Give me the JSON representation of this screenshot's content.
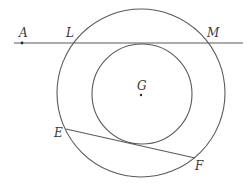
{
  "diagram": {
    "type": "geometry",
    "colors": {
      "stroke": "#5a5a5a",
      "label": "#3a3a3a",
      "background": "#ffffff"
    },
    "center": {
      "label": "G",
      "x": 141,
      "y": 94
    },
    "outer_circle": {
      "cx": 141,
      "cy": 93,
      "r": 84
    },
    "inner_circle": {
      "cx": 142,
      "cy": 94,
      "r": 50
    },
    "line_AM": {
      "x1": 14,
      "y1": 43,
      "x2": 243,
      "y2": 43
    },
    "chord_EF": {
      "x1": 66,
      "y1": 129,
      "x2": 195,
      "y2": 158
    },
    "points": {
      "A": {
        "label": "A",
        "x": 22,
        "y": 43,
        "label_x": 19,
        "label_y": 37
      },
      "L": {
        "label": "L",
        "x": 74,
        "y": 43,
        "label_x": 66,
        "label_y": 37
      },
      "M": {
        "label": "M",
        "x": 207,
        "y": 43,
        "label_x": 207,
        "label_y": 37
      },
      "G": {
        "label": "G",
        "x": 141,
        "y": 95,
        "label_x": 137,
        "label_y": 90
      },
      "E": {
        "label": "E",
        "x": 66,
        "y": 129,
        "label_x": 54,
        "label_y": 137
      },
      "F": {
        "label": "F",
        "x": 195,
        "y": 158,
        "label_x": 195,
        "label_y": 170
      }
    }
  }
}
